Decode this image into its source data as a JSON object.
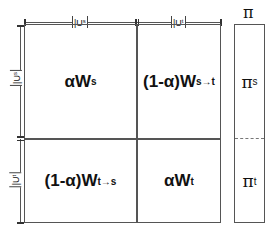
{
  "diagram": {
    "top_dimensions": [
      {
        "base": "|U",
        "sup": "s",
        "close": "|"
      },
      {
        "base": "|U",
        "sup": "t",
        "close": "|"
      }
    ],
    "left_dimensions": [
      {
        "base": "|U",
        "sup": "s",
        "close": "|"
      },
      {
        "base": "|U",
        "sup": "t",
        "close": "|"
      }
    ],
    "cells": {
      "top_left": {
        "base": "αW",
        "sup": "s"
      },
      "top_right": {
        "base": "(1-α)W",
        "sup": "s→t"
      },
      "bottom_left": {
        "base": "(1-α)W",
        "sup": "t→s"
      },
      "bottom_right": {
        "base": "αW",
        "sup": "t"
      }
    },
    "pi_vector": {
      "title": "π",
      "top": {
        "base": "π",
        "sup": "s"
      },
      "bottom": {
        "base": "π",
        "sup": "t"
      }
    },
    "colors": {
      "line": "#555555",
      "text": "#111111",
      "background": "#ffffff"
    }
  }
}
